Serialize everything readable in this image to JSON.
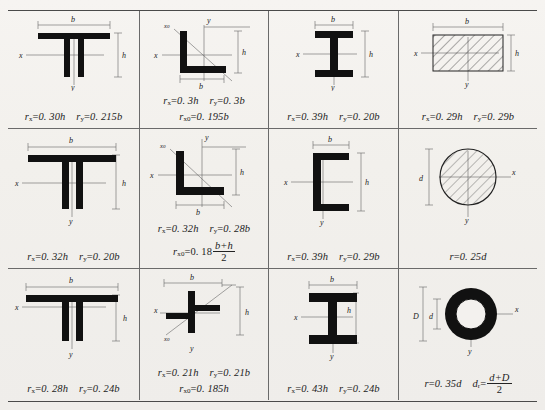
{
  "document": {
    "type": "engineering-reference-table",
    "description": "Radius of gyration values for standard structural cross-sections",
    "grid": {
      "rows": 3,
      "columns": 4
    }
  },
  "cells": [
    {
      "id": "r1c1",
      "shape_name": "double-tee-back-to-back",
      "dimension_labels": [
        "b",
        "h"
      ],
      "axis_labels": [
        "x",
        "y"
      ],
      "formulas": [
        {
          "symbol": "r",
          "subscript": "x",
          "equals": "=",
          "value": "0. 30h"
        },
        {
          "symbol": "r",
          "subscript": "y",
          "equals": "=",
          "value": "0. 215b"
        }
      ]
    },
    {
      "id": "r1c2",
      "shape_name": "equal-leg-angle",
      "dimension_labels": [
        "b",
        "h"
      ],
      "axis_labels": [
        "x",
        "y",
        "x0"
      ],
      "formulas": [
        {
          "symbol": "r",
          "subscript": "x",
          "equals": "=",
          "value": "0. 3h"
        },
        {
          "symbol": "r",
          "subscript": "y",
          "equals": "=",
          "value": "0. 3b"
        },
        {
          "symbol": "r",
          "subscript": "x0",
          "equals": "=",
          "value": "0. 195b"
        }
      ]
    },
    {
      "id": "r1c3",
      "shape_name": "i-beam-narrow-flange",
      "dimension_labels": [
        "b",
        "h"
      ],
      "axis_labels": [
        "x",
        "y"
      ],
      "formulas": [
        {
          "symbol": "r",
          "subscript": "x",
          "equals": "=",
          "value": "0. 39h"
        },
        {
          "symbol": "r",
          "subscript": "y",
          "equals": "=",
          "value": "0. 20b"
        }
      ]
    },
    {
      "id": "r1c4",
      "shape_name": "solid-rectangle",
      "dimension_labels": [
        "b",
        "h"
      ],
      "axis_labels": [
        "x",
        "y"
      ],
      "formulas": [
        {
          "symbol": "r",
          "subscript": "x",
          "equals": "=",
          "value": "0. 29h"
        },
        {
          "symbol": "r",
          "subscript": "y",
          "equals": "=",
          "value": "0. 29b"
        }
      ]
    },
    {
      "id": "r2c1",
      "shape_name": "double-tee-wide-flange",
      "dimension_labels": [
        "b",
        "h"
      ],
      "axis_labels": [
        "x",
        "y"
      ],
      "formulas": [
        {
          "symbol": "r",
          "subscript": "x",
          "equals": "=",
          "value": "0. 32h"
        },
        {
          "symbol": "r",
          "subscript": "y",
          "equals": "=",
          "value": "0. 20b"
        }
      ]
    },
    {
      "id": "r2c2",
      "shape_name": "unequal-leg-angle",
      "dimension_labels": [
        "b",
        "h"
      ],
      "axis_labels": [
        "x",
        "y",
        "x0"
      ],
      "formulas": [
        {
          "symbol": "r",
          "subscript": "x",
          "equals": "=",
          "value": "0. 32h"
        },
        {
          "symbol": "r",
          "subscript": "y",
          "equals": "=",
          "value": "0. 28b"
        }
      ],
      "fraction_formula": {
        "symbol": "r",
        "subscript": "x0",
        "equals": "=",
        "coefficient": "0. 18",
        "numerator": "b+h",
        "denominator": "2"
      }
    },
    {
      "id": "r2c3",
      "shape_name": "channel-section",
      "dimension_labels": [
        "b",
        "h"
      ],
      "axis_labels": [
        "x",
        "y"
      ],
      "formulas": [
        {
          "symbol": "r",
          "subscript": "x",
          "equals": "=",
          "value": "0. 39h"
        },
        {
          "symbol": "r",
          "subscript": "y",
          "equals": "=",
          "value": "0. 29b"
        }
      ]
    },
    {
      "id": "r2c4",
      "shape_name": "solid-circle",
      "dimension_labels": [
        "d"
      ],
      "axis_labels": [
        "x",
        "y"
      ],
      "formulas": [
        {
          "symbol": "r",
          "subscript": "",
          "equals": "=",
          "value": "0. 25d"
        }
      ]
    },
    {
      "id": "r3c1",
      "shape_name": "double-tee-shallow",
      "dimension_labels": [
        "b",
        "h"
      ],
      "axis_labels": [
        "x",
        "y"
      ],
      "formulas": [
        {
          "symbol": "r",
          "subscript": "x",
          "equals": "=",
          "value": "0. 28h"
        },
        {
          "symbol": "r",
          "subscript": "y",
          "equals": "=",
          "value": "0. 24b"
        }
      ]
    },
    {
      "id": "r3c2",
      "shape_name": "cruciform-double-angle",
      "dimension_labels": [
        "b",
        "h"
      ],
      "axis_labels": [
        "x",
        "y",
        "x0"
      ],
      "formulas": [
        {
          "symbol": "r",
          "subscript": "x",
          "equals": "=",
          "value": "0. 21h"
        },
        {
          "symbol": "r",
          "subscript": "y",
          "equals": "=",
          "value": "0. 21b"
        },
        {
          "symbol": "r",
          "subscript": "x0",
          "equals": "=",
          "value": "0. 185h"
        }
      ]
    },
    {
      "id": "r3c3",
      "shape_name": "i-beam-wide-flange",
      "dimension_labels": [
        "b",
        "h"
      ],
      "axis_labels": [
        "x",
        "y"
      ],
      "formulas": [
        {
          "symbol": "r",
          "subscript": "x",
          "equals": "=",
          "value": "0. 43h"
        },
        {
          "symbol": "r",
          "subscript": "y",
          "equals": "=",
          "value": "0. 24b"
        }
      ]
    },
    {
      "id": "r3c4",
      "shape_name": "hollow-circular-tube",
      "dimension_labels": [
        "d",
        "D"
      ],
      "axis_labels": [
        "x",
        "y"
      ],
      "formulas": [
        {
          "symbol": "r",
          "subscript": "",
          "equals": "=",
          "value": "0. 35d"
        }
      ],
      "fraction_formula": {
        "symbol": "d",
        "subscript": "r",
        "equals": "=",
        "coefficient": "",
        "numerator": "d+D",
        "denominator": "2"
      }
    }
  ],
  "colors": {
    "ink": "#111111",
    "rule": "#6a6a6a",
    "paper": "#f3f1ee",
    "dimension_line": "#666666"
  }
}
